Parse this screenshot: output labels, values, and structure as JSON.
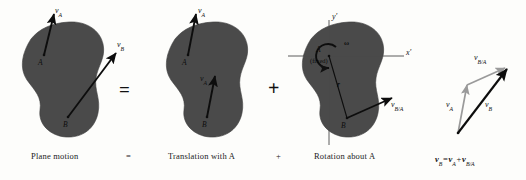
{
  "figure": {
    "title_equation": "v_B = v_A + v_B/A",
    "body_color": "#4a4a4a",
    "vector_color": "#0d0d0d",
    "accent_gray": "#9a9a9a",
    "background": "#fdfdfb"
  },
  "panels": [
    {
      "id": "plane-motion",
      "caption": "Plane motion",
      "points": [
        "A",
        "B"
      ],
      "vectors": [
        {
          "name": "v_A",
          "label_main": "v",
          "label_sub": "A",
          "from": "A",
          "direction": "up-slightly-right"
        },
        {
          "name": "v_B",
          "label_main": "v",
          "label_sub": "B",
          "from": "B",
          "direction": "up-right"
        }
      ]
    },
    {
      "id": "translation",
      "caption": "Translation with A",
      "points": [
        "A",
        "B"
      ],
      "vectors": [
        {
          "name": "v_A_at_A",
          "label_main": "v",
          "label_sub": "A",
          "from": "A",
          "direction": "up-slightly-right"
        },
        {
          "name": "v_A_at_B",
          "label_main": "v",
          "label_sub": "A",
          "from": "B",
          "direction": "up-slightly-right"
        }
      ]
    },
    {
      "id": "rotation",
      "caption": "Rotation about A",
      "points": [
        "A",
        "B"
      ],
      "point_a_note": "(fixed)",
      "axes": [
        {
          "name": "x-prime",
          "label_main": "x",
          "label_prime": "'"
        },
        {
          "name": "y-prime",
          "label_main": "y",
          "label_prime": "'"
        }
      ],
      "omega_label": "ω",
      "radius_label": "r",
      "vectors": [
        {
          "name": "v_B_over_A",
          "label_main": "v",
          "label_sub": "B/A",
          "from": "B",
          "direction": "up-right"
        }
      ]
    },
    {
      "id": "vector-triangle",
      "caption": "",
      "vectors": [
        {
          "name": "v_A",
          "label_main": "v",
          "label_sub": "A",
          "color": "gray"
        },
        {
          "name": "v_B_over_A",
          "label_main": "v",
          "label_sub": "B/A",
          "color": "gray"
        },
        {
          "name": "v_B",
          "label_main": "v",
          "label_sub": "B",
          "color": "black"
        }
      ],
      "equation": {
        "lhs_main": "v",
        "lhs_sub": "B",
        "eq": "=",
        "t1_main": "v",
        "t1_sub": "A",
        "plus": "+",
        "t2_main": "v",
        "t2_sub": "B/A"
      }
    }
  ],
  "operators": [
    {
      "name": "equals-big",
      "symbol": "="
    },
    {
      "name": "plus-big",
      "symbol": "+"
    },
    {
      "name": "equals-caption",
      "symbol": "="
    },
    {
      "name": "plus-caption",
      "symbol": "+"
    }
  ]
}
